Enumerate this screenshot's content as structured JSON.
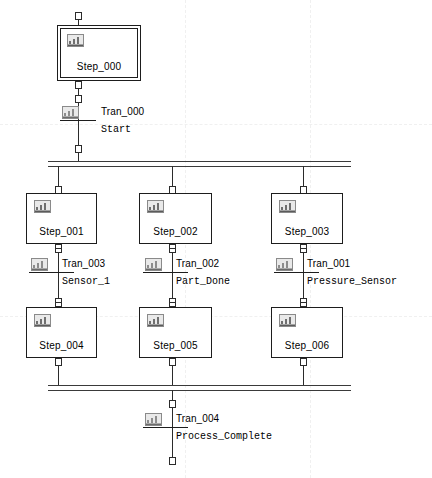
{
  "document": {
    "type": "sfc-diagram",
    "title": "Sequential Function Chart"
  },
  "icons": {
    "step": "step-action-icon",
    "transition": "transition-condition-icon"
  },
  "steps": [
    {
      "id": "step_000",
      "label": "Step_000",
      "initial": true
    },
    {
      "id": "step_001",
      "label": "Step_001",
      "initial": false
    },
    {
      "id": "step_002",
      "label": "Step_002",
      "initial": false
    },
    {
      "id": "step_003",
      "label": "Step_003",
      "initial": false
    },
    {
      "id": "step_004",
      "label": "Step_004",
      "initial": false
    },
    {
      "id": "step_005",
      "label": "Step_005",
      "initial": false
    },
    {
      "id": "step_006",
      "label": "Step_006",
      "initial": false
    }
  ],
  "transitions": [
    {
      "id": "tran_000",
      "name": "Tran_000",
      "condition": "Start"
    },
    {
      "id": "tran_003",
      "name": "Tran_003",
      "condition": "Sensor_1"
    },
    {
      "id": "tran_002",
      "name": "Tran_002",
      "condition": "Part_Done"
    },
    {
      "id": "tran_001",
      "name": "Tran_001",
      "condition": "Pressure_Sensor"
    },
    {
      "id": "tran_004",
      "name": "Tran_004",
      "condition": "Process_Complete"
    }
  ],
  "branches": {
    "divergence_label": "parallel-divergence",
    "convergence_label": "parallel-convergence"
  },
  "colors": {
    "line": "#2b2b2b",
    "box_border": "#1d1d1d",
    "background": "#ffffff",
    "guide": "#f0f0f0",
    "icon_fill": "#d6d6d6",
    "icon_border": "#7a7a7a"
  }
}
